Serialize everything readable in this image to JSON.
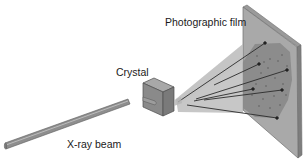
{
  "diagram": {
    "labels": {
      "film": "Photographic film",
      "crystal": "Crystal",
      "beam": "X-ray beam"
    },
    "components": [
      {
        "id": "x-ray-beam",
        "label": "X-ray beam",
        "shape": "cylinder",
        "from": [
          5,
          147
        ],
        "to": [
          130,
          102
        ]
      },
      {
        "id": "crystal",
        "label": "Crystal",
        "shape": "cube"
      },
      {
        "id": "diffracted-cone",
        "shape": "cone",
        "apex": [
          178,
          104
        ]
      },
      {
        "id": "photographic-film",
        "label": "Photographic film",
        "shape": "plate"
      }
    ],
    "diffracted_rays": 6,
    "diffraction_spots_visible": true,
    "colors": {
      "beam": "#8e8e8e",
      "beam_highlight": "#b8b8b8",
      "crystal_front": "#8a8a8a",
      "crystal_top": "#a8a8a8",
      "crystal_side": "#7a7a7a",
      "cone": "#b4b4b4",
      "film_face": "#a9a9a9",
      "film_edge": "#7e7e7e",
      "exposed_region": "#8a8a8a",
      "rays": "#2b2b2b",
      "text": "#1a1a1a"
    }
  }
}
